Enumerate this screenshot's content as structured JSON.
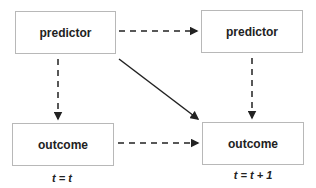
{
  "nodes": {
    "predictor_t": {
      "label": "predictor"
    },
    "predictor_t1": {
      "label": "predictor"
    },
    "outcome_t": {
      "label": "outcome"
    },
    "outcome_t1": {
      "label": "outcome"
    }
  },
  "time_labels": {
    "t": "t = t",
    "t1": "t = t + 1"
  },
  "edges": [
    {
      "from": "predictor_t",
      "to": "predictor_t1",
      "style": "dashed"
    },
    {
      "from": "predictor_t",
      "to": "outcome_t",
      "style": "dashed"
    },
    {
      "from": "predictor_t1",
      "to": "outcome_t1",
      "style": "dashed"
    },
    {
      "from": "outcome_t",
      "to": "outcome_t1",
      "style": "dashed"
    },
    {
      "from": "predictor_t",
      "to": "outcome_t1",
      "style": "solid"
    }
  ]
}
